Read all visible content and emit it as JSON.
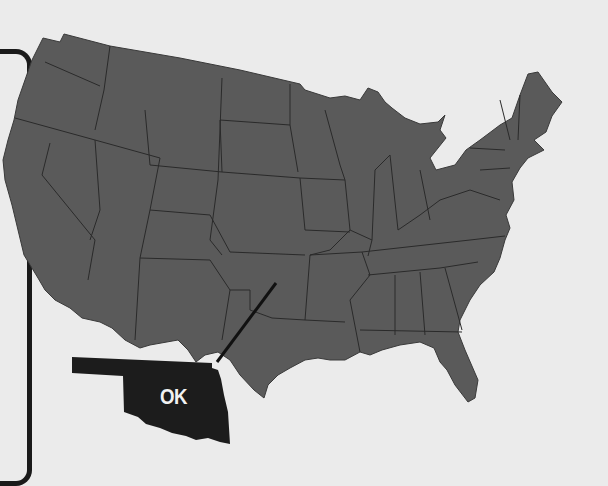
{
  "map": {
    "title": "",
    "region": "Contiguous United States",
    "highlighted_state": {
      "abbr": "OK",
      "label": "OK",
      "name": "Oklahoma"
    },
    "colors": {
      "background": "#ebebeb",
      "states_fill": "#5a5a5a",
      "state_borders": "#2a2a2a",
      "highlight_fill": "#1c1c1c",
      "label_text": "#f2f2f2",
      "frame": "#1a1a1a"
    }
  }
}
